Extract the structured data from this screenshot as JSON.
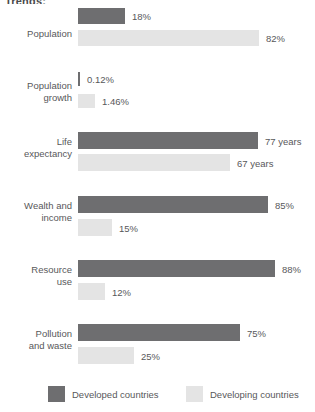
{
  "chart_data": {
    "type": "bar",
    "orientation": "horizontal",
    "title": "Trends:",
    "xlabel": "",
    "ylabel": "",
    "grid": false,
    "legend_position": "bottom",
    "categories": [
      "Population",
      "Population growth",
      "Life expectancy",
      "Wealth and income",
      "Resource use",
      "Pollution and waste"
    ],
    "series": [
      {
        "name": "Developed countries",
        "color": "#6e6e70",
        "values": [
          18,
          0.12,
          77,
          85,
          88,
          75
        ],
        "labels": [
          "18%",
          "0.12%",
          "77 years",
          "85%",
          "88%",
          "75%"
        ]
      },
      {
        "name": "Developing countries",
        "color": "#e4e4e4",
        "values": [
          82,
          1.46,
          67,
          15,
          12,
          25
        ],
        "labels": [
          "82%",
          "1.46%",
          "67 years",
          "15%",
          "12%",
          "25%"
        ]
      }
    ]
  },
  "rows": [
    {
      "label_line1": "Population",
      "label_line2": "",
      "developed": {
        "label": "18%",
        "width": 47
      },
      "developing": {
        "label": "82%",
        "width": 181
      }
    },
    {
      "label_line1": "Population",
      "label_line2": "growth",
      "developed": {
        "label": "0.12%",
        "width": 2
      },
      "developing": {
        "label": "1.46%",
        "width": 17
      }
    },
    {
      "label_line1": "Life",
      "label_line2": "expectancy",
      "developed": {
        "label": "77 years",
        "width": 180
      },
      "developing": {
        "label": "67 years",
        "width": 152
      }
    },
    {
      "label_line1": "Wealth and",
      "label_line2": "income",
      "developed": {
        "label": "85%",
        "width": 190
      },
      "developing": {
        "label": "15%",
        "width": 34
      }
    },
    {
      "label_line1": "Resource",
      "label_line2": "use",
      "developed": {
        "label": "88%",
        "width": 197
      },
      "developing": {
        "label": "12%",
        "width": 27
      }
    },
    {
      "label_line1": "Pollution",
      "label_line2": "and waste",
      "developed": {
        "label": "75%",
        "width": 162
      },
      "developing": {
        "label": "25%",
        "width": 56
      }
    }
  ],
  "legend": {
    "developed_label": "Developed countries",
    "developing_label": "Developing countries"
  },
  "colors": {
    "developed": "#6e6e70",
    "developing": "#e4e4e4",
    "text": "#58585a",
    "background": "#ffffff"
  }
}
